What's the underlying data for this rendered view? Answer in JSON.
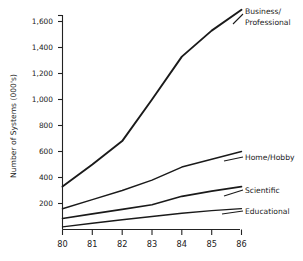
{
  "chart_data": {
    "type": "line",
    "title": "",
    "xlabel": "",
    "ylabel": "Number of Systems (000's)",
    "x": [
      80,
      81,
      82,
      83,
      84,
      85,
      86
    ],
    "xtick_labels": [
      "80",
      "81",
      "82",
      "83",
      "84",
      "85",
      "86"
    ],
    "ytick_labels": [
      "200",
      "400",
      "600",
      "800",
      "1,000",
      "1,200",
      "1,400",
      "1,600"
    ],
    "ytick_values": [
      200,
      400,
      600,
      800,
      1000,
      1200,
      1400,
      1600
    ],
    "xlim": [
      80,
      86
    ],
    "ylim": [
      0,
      1700
    ],
    "grid": false,
    "legend_position": "right-inline-labels",
    "series": [
      {
        "name": "Business/ Professional",
        "label_line_1": "Business/",
        "label_line_2": "Professional",
        "values": [
          330,
          500,
          680,
          1000,
          1330,
          1530,
          1690
        ]
      },
      {
        "name": "Home/Hobby",
        "label_line_1": "Home/Hobby",
        "label_line_2": "",
        "values": [
          160,
          230,
          300,
          380,
          480,
          540,
          600
        ]
      },
      {
        "name": "Scientific",
        "label_line_1": "Scientific",
        "label_line_2": "",
        "values": [
          85,
          120,
          155,
          190,
          255,
          295,
          330
        ]
      },
      {
        "name": "Educational",
        "label_line_1": "Educational",
        "label_line_2": "",
        "values": [
          20,
          48,
          75,
          100,
          125,
          145,
          160
        ]
      }
    ]
  }
}
